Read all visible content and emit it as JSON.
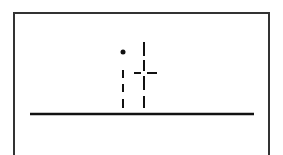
{
  "figure": {
    "letters": "it",
    "stroke_color": "#111111",
    "frame_color": "#333333",
    "background": "#ffffff"
  },
  "glyphs": [
    {
      "char": "i",
      "dot": {
        "cx": 123,
        "cy": 52,
        "r": 2.5
      },
      "dashes": [
        {
          "x1": 123,
          "y1": 70,
          "x2": 123,
          "y2": 78
        },
        {
          "x1": 123,
          "y1": 84,
          "x2": 123,
          "y2": 92
        },
        {
          "x1": 123,
          "y1": 99,
          "x2": 123,
          "y2": 108
        }
      ]
    },
    {
      "char": "t",
      "dashes": [
        {
          "x1": 144,
          "y1": 42,
          "x2": 144,
          "y2": 56
        },
        {
          "x1": 144,
          "y1": 60,
          "x2": 144,
          "y2": 71
        },
        {
          "x1": 144,
          "y1": 76,
          "x2": 144,
          "y2": 90
        },
        {
          "x1": 144,
          "y1": 96,
          "x2": 144,
          "y2": 108
        },
        {
          "x1": 134,
          "y1": 73,
          "x2": 141,
          "y2": 73
        },
        {
          "x1": 147,
          "y1": 73,
          "x2": 157,
          "y2": 73
        }
      ]
    }
  ],
  "baseline": {
    "x1": 30,
    "y1": 114,
    "x2": 254,
    "y2": 114
  }
}
